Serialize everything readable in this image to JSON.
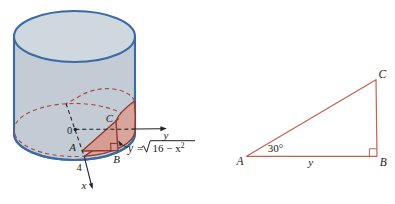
{
  "colors": {
    "cylinder_stroke": "#3a6ba6",
    "cylinder_side_fill": "#c3ccd5",
    "cylinder_top_fill": "#cfd7df",
    "cut_dash_red": "#a8493d",
    "wedge_edge": "#8e3931",
    "wedge_fill": "#d9a59b",
    "triangle_fill": "#d79d92",
    "right_triangle_stroke": "#c4604f",
    "ink": "#222222"
  },
  "left_figure": {
    "origin": "0",
    "vertex_a": "A",
    "vertex_b": "B",
    "vertex_c": "C",
    "radius_tick": "4",
    "x_axis": "x",
    "y_axis": "y",
    "equation": {
      "lhs": "y",
      "equals": "=",
      "radicand": "16 − x",
      "exponent": "2"
    }
  },
  "right_figure": {
    "vertex_a": "A",
    "vertex_b": "B",
    "vertex_c": "C",
    "angle": "30°",
    "base": "y"
  }
}
